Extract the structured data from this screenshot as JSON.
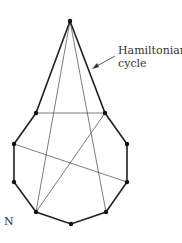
{
  "diagram": {
    "annotation": {
      "line1": "Hamiltonian",
      "line2": "cycle"
    },
    "corner_label": "N",
    "vertices": [
      {
        "id": "T",
        "x": 70,
        "y": 21
      },
      {
        "id": "A",
        "x": 36,
        "y": 113
      },
      {
        "id": "B",
        "x": 105,
        "y": 113
      },
      {
        "id": "L1",
        "x": 14,
        "y": 144
      },
      {
        "id": "R1",
        "x": 127,
        "y": 144
      },
      {
        "id": "L2",
        "x": 14,
        "y": 182
      },
      {
        "id": "R2",
        "x": 127,
        "y": 182
      },
      {
        "id": "BL",
        "x": 36,
        "y": 212
      },
      {
        "id": "BM",
        "x": 71,
        "y": 224
      },
      {
        "id": "BR",
        "x": 106,
        "y": 212
      }
    ],
    "hamiltonian_cycle_edges": [
      [
        "T",
        "A"
      ],
      [
        "A",
        "L1"
      ],
      [
        "L1",
        "L2"
      ],
      [
        "L2",
        "BL"
      ],
      [
        "BL",
        "BM"
      ],
      [
        "BM",
        "BR"
      ],
      [
        "BR",
        "R2"
      ],
      [
        "R2",
        "R1"
      ],
      [
        "R1",
        "B"
      ],
      [
        "B",
        "T"
      ]
    ],
    "other_edges": [
      [
        "A",
        "B"
      ],
      [
        "T",
        "BL"
      ],
      [
        "T",
        "BR"
      ],
      [
        "B",
        "BL"
      ],
      [
        "L1",
        "R2"
      ]
    ],
    "colors": {
      "edge": "#222222",
      "vertex": "#111111",
      "text": "#333333"
    }
  }
}
